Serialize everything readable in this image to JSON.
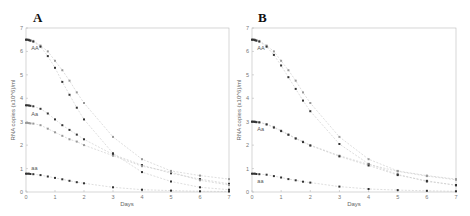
{
  "chart_data": [
    {
      "type": "line",
      "panel": "A",
      "title": "A",
      "xlabel": "Days",
      "ylabel": "RNA copies (x10^6)/ml",
      "xlim": [
        0,
        7
      ],
      "ylim": [
        0,
        7
      ],
      "xticks": [
        "0",
        "1",
        "2",
        "3",
        "4",
        "5",
        "6",
        "7"
      ],
      "yticks": [
        "0",
        "1",
        "2",
        "3",
        "4",
        "5",
        "6",
        "7"
      ],
      "grid": false,
      "x": [
        0,
        0.05,
        0.1,
        0.15,
        0.25,
        0.5,
        0.75,
        1,
        1.25,
        1.5,
        1.75,
        2,
        3,
        4,
        5,
        6,
        7
      ],
      "series": [
        {
          "name": "AA (upper)",
          "color": "#999999",
          "marker": "dot-light",
          "values": [
            6.5,
            6.5,
            6.5,
            6.48,
            6.45,
            6.25,
            6.0,
            5.6,
            5.2,
            4.75,
            4.25,
            3.8,
            2.35,
            1.4,
            0.9,
            0.7,
            0.55
          ]
        },
        {
          "name": "AA (lower)",
          "color": "#333333",
          "marker": "dot-dark",
          "values": [
            6.5,
            6.5,
            6.48,
            6.46,
            6.42,
            6.2,
            5.8,
            5.3,
            4.7,
            4.15,
            3.6,
            3.1,
            1.65,
            0.85,
            0.45,
            0.2,
            0.1
          ]
        },
        {
          "name": "Aa (upper)",
          "color": "#333333",
          "marker": "dot-dark",
          "values": [
            3.7,
            3.7,
            3.69,
            3.68,
            3.66,
            3.55,
            3.35,
            3.1,
            2.85,
            2.65,
            2.45,
            2.25,
            1.6,
            1.15,
            0.8,
            0.55,
            0.35
          ]
        },
        {
          "name": "Aa (lower)",
          "color": "#999999",
          "marker": "dot-light",
          "values": [
            2.95,
            2.95,
            2.94,
            2.93,
            2.92,
            2.85,
            2.7,
            2.55,
            2.4,
            2.25,
            2.15,
            2.0,
            1.55,
            1.1,
            0.85,
            0.5,
            0.3
          ]
        },
        {
          "name": "aa",
          "color": "#333333",
          "marker": "dot-dark",
          "values": [
            0.78,
            0.78,
            0.78,
            0.77,
            0.76,
            0.72,
            0.66,
            0.6,
            0.54,
            0.48,
            0.42,
            0.37,
            0.2,
            0.1,
            0.06,
            0.03,
            0.02
          ]
        }
      ],
      "annotations": [
        {
          "text": "AA",
          "x": 0.15,
          "y": 6.05
        },
        {
          "text": "Aa",
          "x": 0.15,
          "y": 3.25
        },
        {
          "text": "aa",
          "x": 0.15,
          "y": 0.95
        }
      ]
    },
    {
      "type": "line",
      "panel": "B",
      "title": "B",
      "xlabel": "Days",
      "ylabel": "RNA copies (x10^6)/ml",
      "xlim": [
        0,
        7
      ],
      "ylim": [
        0,
        7
      ],
      "xticks": [
        "0",
        "1",
        "2",
        "3",
        "4",
        "5",
        "6",
        "7"
      ],
      "yticks": [
        "0",
        "1",
        "2",
        "3",
        "4",
        "5",
        "6",
        "7"
      ],
      "grid": false,
      "x": [
        0,
        0.05,
        0.1,
        0.15,
        0.25,
        0.5,
        0.75,
        1,
        1.25,
        1.5,
        1.75,
        2,
        3,
        4,
        5,
        6,
        7
      ],
      "series": [
        {
          "name": "AA (upper)",
          "color": "#999999",
          "marker": "dot-light",
          "values": [
            6.5,
            6.5,
            6.5,
            6.48,
            6.45,
            6.25,
            6.0,
            5.6,
            5.2,
            4.75,
            4.25,
            3.8,
            2.35,
            1.4,
            0.9,
            0.7,
            0.55
          ]
        },
        {
          "name": "AA (lower)",
          "color": "#333333",
          "marker": "dot-dark",
          "values": [
            6.5,
            6.5,
            6.48,
            6.46,
            6.42,
            6.2,
            5.85,
            5.4,
            4.9,
            4.4,
            3.9,
            3.45,
            2.05,
            1.2,
            0.75,
            0.45,
            0.3
          ]
        },
        {
          "name": "Aa (upper)",
          "color": "#999999",
          "marker": "dot-light",
          "values": [
            3.0,
            3.0,
            3.0,
            2.99,
            2.98,
            2.9,
            2.78,
            2.62,
            2.46,
            2.3,
            2.15,
            2.0,
            1.55,
            1.18,
            0.88,
            0.68,
            0.52
          ]
        },
        {
          "name": "Aa (lower)",
          "color": "#333333",
          "marker": "dot-dark",
          "values": [
            3.0,
            3.0,
            2.99,
            2.98,
            2.97,
            2.88,
            2.75,
            2.6,
            2.44,
            2.28,
            2.13,
            1.98,
            1.52,
            1.13,
            0.72,
            0.48,
            0.28
          ]
        },
        {
          "name": "aa",
          "color": "#333333",
          "marker": "dot-dark",
          "values": [
            0.78,
            0.78,
            0.78,
            0.77,
            0.76,
            0.74,
            0.68,
            0.62,
            0.55,
            0.5,
            0.44,
            0.4,
            0.23,
            0.13,
            0.08,
            0.05,
            0.03
          ]
        }
      ],
      "annotations": [
        {
          "text": "AA",
          "x": 0.15,
          "y": 6.05
        },
        {
          "text": "Aa",
          "x": 0.15,
          "y": 2.6
        },
        {
          "text": "aa",
          "x": 0.15,
          "y": 0.4
        }
      ]
    }
  ],
  "panels": [
    {
      "letter": "A",
      "xlabel": "Days",
      "ylabel": "RNA copies (x10^6)/ml"
    },
    {
      "letter": "B",
      "xlabel": "Days",
      "ylabel": "RNA copies (x10^6)/ml"
    }
  ]
}
